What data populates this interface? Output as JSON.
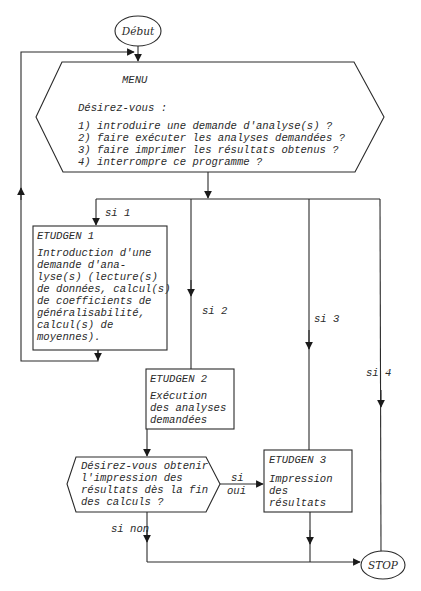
{
  "diagram": {
    "type": "flowchart",
    "colors": {
      "stroke": "#2a2a2a",
      "text": "#2a2a2a",
      "background": "#ffffff"
    },
    "start": {
      "label": "Début"
    },
    "menu": {
      "title": "MENU",
      "prompt": "Désirez-vous :",
      "options": [
        "1) introduire une demande d'analyse(s) ?",
        "2) faire exécuter les analyses demandées ?",
        "3) faire imprimer les résultats obtenus ?",
        "4) interrompre ce programme ?"
      ]
    },
    "branches": {
      "si1": "si 1",
      "si2": "si 2",
      "si3": "si 3",
      "si4": "si 4",
      "si_oui_1": "si",
      "si_oui_2": "oui",
      "si_non": "si non"
    },
    "etudgen1": {
      "title": "ETUDGEN 1",
      "lines": [
        "Introduction d'une",
        "demande d'ana-",
        "lyse(s) (lecture(s)",
        "de données, calcul(s)",
        "de coefficients de",
        "généralisabilité,",
        "calcul(s) de",
        "moyennes)."
      ]
    },
    "etudgen2": {
      "title": "ETUDGEN 2",
      "lines": [
        "Exécution",
        "des analyses",
        "demandées"
      ]
    },
    "decision": {
      "lines": [
        "Désirez-vous obtenir",
        "l'impression des",
        "résultats dès la fin",
        "des calculs ?"
      ]
    },
    "etudgen3": {
      "title": "ETUDGEN 3",
      "lines": [
        "Impression",
        "des",
        "résultats"
      ]
    },
    "stop": {
      "label": "STOP"
    }
  }
}
